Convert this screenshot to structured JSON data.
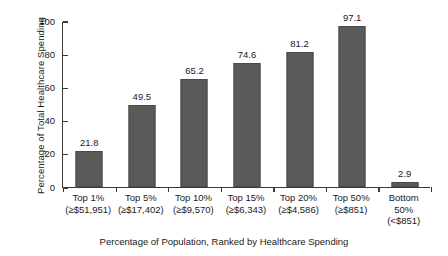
{
  "chart_data": {
    "type": "bar",
    "title": "",
    "xlabel": "Percentage of Population, Ranked by Healthcare Spending",
    "ylabel": "Percentage of Total Healthcare Spending",
    "ylim": [
      0,
      100
    ],
    "yticks": [
      "0",
      "20",
      "40",
      "60",
      "80",
      "100"
    ],
    "grid": false,
    "legend": "none",
    "bar_color": "#5a5a5a",
    "categories": [
      "Top 1% (≥$51,951)",
      "Top 5% (≥$17,402)",
      "Top 10% (≥$9,570)",
      "Top 15% (≥$6,343)",
      "Top 20% (≥$4,586)",
      "Top 50% (≥$851)",
      "Bottom 50% (<$851)"
    ],
    "values": [
      21.8,
      49.5,
      65.2,
      74.6,
      81.2,
      97.1,
      2.9
    ],
    "category_lines": [
      [
        "Top 1%",
        "(≥$51,951)",
        ""
      ],
      [
        "Top 5%",
        "(≥$17,402)",
        ""
      ],
      [
        "Top 10%",
        "(≥$9,570)",
        ""
      ],
      [
        "Top 15%",
        "(≥$6,343)",
        ""
      ],
      [
        "Top 20%",
        "(≥$4,586)",
        ""
      ],
      [
        "Top 50%",
        "(≥$851)",
        ""
      ],
      [
        "Bottom",
        "50%",
        "(<$851)"
      ]
    ],
    "value_labels": [
      "21.8",
      "49.5",
      "65.2",
      "74.6",
      "81.2",
      "97.1",
      "2.9"
    ]
  }
}
